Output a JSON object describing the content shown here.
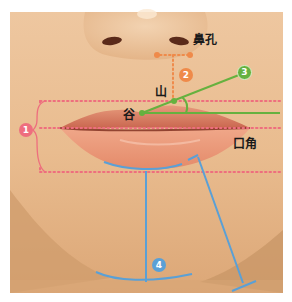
{
  "figure": {
    "labels": {
      "nostril": "鼻孔",
      "peak": "山",
      "valley": "谷",
      "mouth_corner": "口角"
    },
    "markers": [
      {
        "id": "1",
        "meaning": "lip height range",
        "color": "#ee6e7e"
      },
      {
        "id": "2",
        "meaning": "nostril to lip peak distance",
        "color": "#ef8a4a"
      },
      {
        "id": "3",
        "meaning": "lip peak angle",
        "color": "#66b13f"
      },
      {
        "id": "4",
        "meaning": "lower lip to chin",
        "color": "#5aa0d6"
      }
    ],
    "colors": {
      "skin": "#e9bc8f",
      "skin_shadow": "#c99768",
      "lip": "#e58d6f",
      "pink_dots": "#ee6e7e",
      "orange_dots": "#ef8a4a",
      "green": "#66b13f",
      "blue": "#5aa0d6"
    }
  }
}
